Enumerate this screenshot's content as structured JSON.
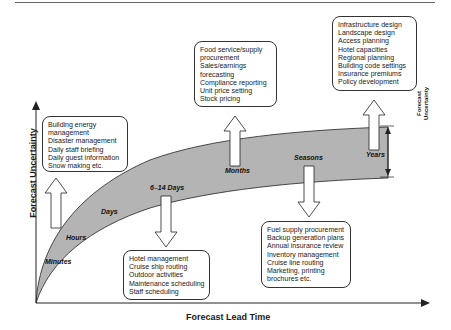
{
  "axes": {
    "x_label": "Forecast Lead Time",
    "y_label": "Forecast Uncertainty"
  },
  "band_label": [
    "Forecast",
    "Uncertainty"
  ],
  "time_scales": [
    {
      "label": "Minutes"
    },
    {
      "label": "Hours"
    },
    {
      "label": "Days"
    },
    {
      "label": "6–14 Days"
    },
    {
      "label": "Months"
    },
    {
      "label": "Seasons"
    },
    {
      "label": "Years"
    }
  ],
  "boxes": {
    "hours": [
      "Building energy",
      "management",
      "Disaster management",
      "Daily staff briefing",
      "Daily guest information",
      "Snow making etc."
    ],
    "six_fourteen_days": [
      "Hotel management",
      "Cruise ship routing",
      "Outdoor activities",
      "Maintenance scheduling",
      "Staff scheduling"
    ],
    "months": [
      "Food service/supply",
      "procurement",
      "Sales/earnings",
      "forecasting",
      "Compliance reporting",
      "Unit price setting",
      "Stock pricing"
    ],
    "seasons": [
      "Fuel supply procurement",
      "Backup generation plans",
      "Annual insurance review",
      "Inventory management",
      "Cruise line routing",
      "Marketing, printing",
      "brochures etc."
    ],
    "years": [
      "Infrastructure design",
      "Landscape design",
      "Access planning",
      "Hotel capacities",
      "Regional planning",
      "Building code settings",
      "Insurance premiums",
      "Policy development"
    ]
  },
  "colors": {
    "band_fill": "#b4b4b4",
    "line": "#222222"
  }
}
